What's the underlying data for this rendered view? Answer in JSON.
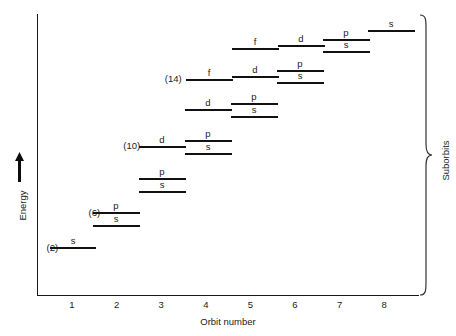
{
  "chart_data": {
    "type": "line",
    "title": "",
    "xlabel": "Orbit number",
    "ylabel": "Energy",
    "bracket_label": "Suborbits",
    "xlim": [
      0.4,
      8.8
    ],
    "xticks": [
      1,
      2,
      3,
      4,
      5,
      6,
      7,
      8
    ],
    "xticklabels": [
      "1",
      "2",
      "3",
      "4",
      "5",
      "6",
      "7",
      "8"
    ],
    "grid": false,
    "axis_note": "Energy increases upward (arrow); y-axis has no numeric ticks",
    "capacity_labels": [
      {
        "text": "(2)",
        "subshell": "s",
        "x": 0.78,
        "y_px": 247
      },
      {
        "text": "(6)",
        "subshell": "p",
        "x": 1.72,
        "y_px": 212
      },
      {
        "text": "(10)",
        "subshell": "d",
        "x": 2.62,
        "y_px": 145
      },
      {
        "text": "(14)",
        "subshell": "f",
        "x": 3.55,
        "y_px": 78
      }
    ],
    "levels": [
      {
        "label": "s",
        "orbit": 1,
        "x0_px": 50,
        "x1_px": 96,
        "y_px": 247,
        "label_x_px": 73
      },
      {
        "label": "p",
        "orbit": 2,
        "x0_px": 93,
        "x1_px": 140,
        "y_px": 212,
        "label_x_px": 116
      },
      {
        "label": "s",
        "orbit": 2,
        "x0_px": 93,
        "x1_px": 140,
        "y_px": 225,
        "label_x_px": 116
      },
      {
        "label": "p",
        "orbit": 3,
        "x0_px": 139,
        "x1_px": 186,
        "y_px": 178,
        "label_x_px": 162
      },
      {
        "label": "s",
        "orbit": 3,
        "x0_px": 139,
        "x1_px": 186,
        "y_px": 191,
        "label_x_px": 162
      },
      {
        "label": "d",
        "orbit": 3,
        "x0_px": 139,
        "x1_px": 186,
        "y_px": 146,
        "label_x_px": 162
      },
      {
        "label": "p",
        "orbit": 4,
        "x0_px": 185,
        "x1_px": 232,
        "y_px": 140,
        "label_x_px": 208
      },
      {
        "label": "s",
        "orbit": 4,
        "x0_px": 185,
        "x1_px": 232,
        "y_px": 153,
        "label_x_px": 208
      },
      {
        "label": "d",
        "orbit": 4,
        "x0_px": 185,
        "x1_px": 232,
        "y_px": 109,
        "label_x_px": 208
      },
      {
        "label": "p",
        "orbit": 5,
        "x0_px": 231,
        "x1_px": 278,
        "y_px": 103,
        "label_x_px": 254
      },
      {
        "label": "s",
        "orbit": 5,
        "x0_px": 231,
        "x1_px": 278,
        "y_px": 116,
        "label_x_px": 254
      },
      {
        "label": "f",
        "orbit": 4,
        "x0_px": 186,
        "x1_px": 233,
        "y_px": 79,
        "label_x_px": 209
      },
      {
        "label": "d",
        "orbit": 5,
        "x0_px": 232,
        "x1_px": 279,
        "y_px": 76,
        "label_x_px": 255
      },
      {
        "label": "p",
        "orbit": 6,
        "x0_px": 277,
        "x1_px": 324,
        "y_px": 70,
        "label_x_px": 300
      },
      {
        "label": "s",
        "orbit": 6,
        "x0_px": 277,
        "x1_px": 324,
        "y_px": 82,
        "label_x_px": 300
      },
      {
        "label": "f",
        "orbit": 5,
        "x0_px": 232,
        "x1_px": 279,
        "y_px": 48,
        "label_x_px": 255
      },
      {
        "label": "d",
        "orbit": 6,
        "x0_px": 278,
        "x1_px": 325,
        "y_px": 45,
        "label_x_px": 301
      },
      {
        "label": "p",
        "orbit": 7,
        "x0_px": 323,
        "x1_px": 370,
        "y_px": 39,
        "label_x_px": 346
      },
      {
        "label": "s",
        "orbit": 7,
        "x0_px": 323,
        "x1_px": 370,
        "y_px": 51,
        "label_x_px": 346
      },
      {
        "label": "s",
        "orbit": 8,
        "x0_px": 368,
        "x1_px": 415,
        "y_px": 30,
        "label_x_px": 391
      }
    ]
  }
}
